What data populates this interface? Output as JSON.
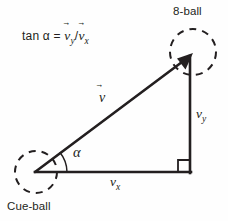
{
  "figure": {
    "background_color": "#fefefe",
    "stroke_color": "#231f20",
    "labels": {
      "eight_ball": "8-ball",
      "cue_ball": "Cue-ball",
      "formula": "tan α = ",
      "formula_numerator": "v",
      "formula_numerator_sub": "y",
      "formula_divider": "/",
      "formula_denominator": "v",
      "formula_denominator_sub": "x",
      "vector": "v",
      "angle": "α",
      "component_x": "v",
      "component_x_sub": "x",
      "component_y": "v",
      "component_y_sub": "y",
      "vector_arrow": "⃗"
    },
    "geometry": {
      "origin": [
        35,
        172
      ],
      "apex": [
        190,
        55
      ],
      "corner": [
        190,
        172
      ],
      "cue_ball_circle": {
        "cx": 36,
        "cy": 172,
        "r": 21
      },
      "eight_ball_circle": {
        "cx": 193,
        "cy": 52,
        "r": 23
      },
      "angle_arc_radius": 32,
      "right_angle_size": 12
    }
  }
}
